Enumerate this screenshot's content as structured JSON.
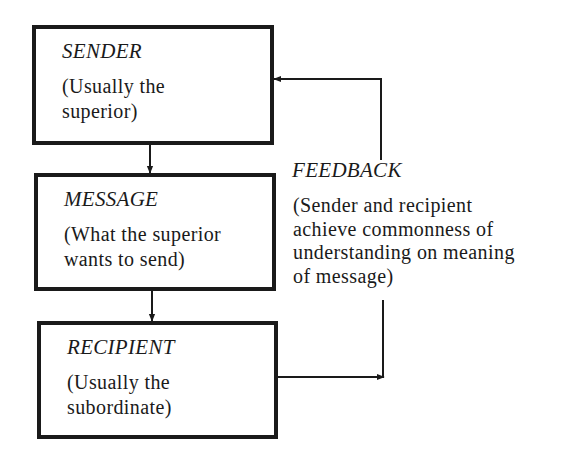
{
  "diagram": {
    "type": "communication-flow",
    "nodes": [
      {
        "id": "sender",
        "title": "SENDER",
        "description": "(Usually the\nsuperior)"
      },
      {
        "id": "message",
        "title": "MESSAGE",
        "description": "(What the superior\nwants to send)"
      },
      {
        "id": "recipient",
        "title": "RECIPIENT",
        "description": "(Usually the\nsubordinate)"
      }
    ],
    "feedback": {
      "title": "FEEDBACK",
      "description": "(Sender and recipient\nachieve commonness of\nunderstanding on meaning\nof message)"
    },
    "edges": [
      {
        "from": "sender",
        "to": "message"
      },
      {
        "from": "message",
        "to": "recipient"
      },
      {
        "from": "recipient",
        "to": "feedback"
      },
      {
        "from": "feedback",
        "to": "sender"
      }
    ],
    "colors": {
      "ink": "#1a1a1a",
      "background": "#ffffff"
    }
  }
}
